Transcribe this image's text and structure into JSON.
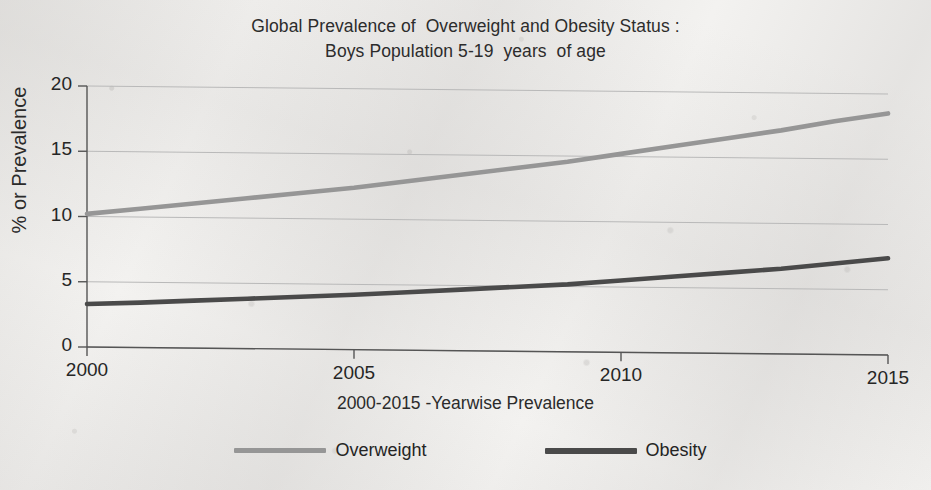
{
  "figure": {
    "title_line1": "Global Prevalence of  Overweight and Obesity Status :",
    "title_line2": "Boys Population 5-19  years  of age",
    "background_color": "#f3f2f0"
  },
  "axes": {
    "y_title": "% or Prevalence",
    "x_title": "2000-2015 -Yearwise Prevalence",
    "y_ticks": [
      "0",
      "5",
      "10",
      "15",
      "20"
    ],
    "x_ticks": [
      "2000",
      "2005",
      "2010",
      "2015"
    ],
    "axis_color": "#555555",
    "grid_color": "#b9b9b9"
  },
  "legend": {
    "entries": [
      {
        "label": "Overweight",
        "color": "#969696"
      },
      {
        "label": "Obesity",
        "color": "#4a4a4a"
      }
    ]
  },
  "chart_data": {
    "type": "line",
    "title": "Global Prevalence of  Overweight and Obesity Status : Boys Population 5-19  years  of age",
    "xlabel": "2000-2015 -Yearwise Prevalence",
    "ylabel": "% or Prevalence",
    "xlim": [
      2000,
      2015
    ],
    "ylim": [
      0,
      20
    ],
    "xticks": [
      2000,
      2005,
      2010,
      2015
    ],
    "yticks": [
      0,
      5,
      10,
      15,
      20
    ],
    "grid": true,
    "grid_axis": "y",
    "legend_position": "bottom",
    "x": [
      2000,
      2001,
      2002,
      2003,
      2004,
      2005,
      2006,
      2007,
      2008,
      2009,
      2010,
      2011,
      2012,
      2013,
      2014,
      2015
    ],
    "series": [
      {
        "name": "Overweight",
        "color": "#969696",
        "values": [
          10.2,
          10.6,
          11.0,
          11.4,
          11.8,
          12.2,
          12.7,
          13.2,
          13.7,
          14.2,
          14.8,
          15.4,
          16.0,
          16.6,
          17.3,
          17.9
        ]
      },
      {
        "name": "Obesity",
        "color": "#4a4a4a",
        "values": [
          3.3,
          3.4,
          3.55,
          3.7,
          3.85,
          4.0,
          4.2,
          4.4,
          4.6,
          4.8,
          5.1,
          5.4,
          5.7,
          6.0,
          6.4,
          6.8
        ]
      }
    ]
  }
}
